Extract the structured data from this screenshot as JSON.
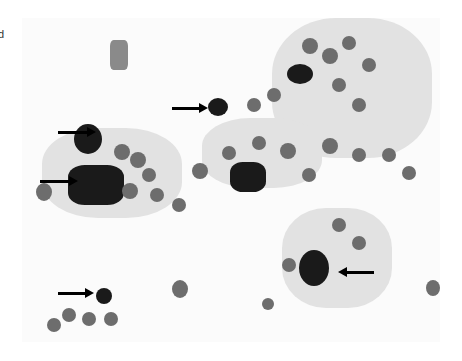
{
  "figure": {
    "panel_label": "d",
    "arrows": [
      {
        "x": 57,
        "y": 132,
        "direction": "right"
      },
      {
        "x": 38,
        "y": 181,
        "direction": "right"
      },
      {
        "x": 172,
        "y": 108,
        "direction": "right"
      },
      {
        "x": 352,
        "y": 272,
        "direction": "left"
      },
      {
        "x": 58,
        "y": 293,
        "direction": "right"
      }
    ]
  }
}
